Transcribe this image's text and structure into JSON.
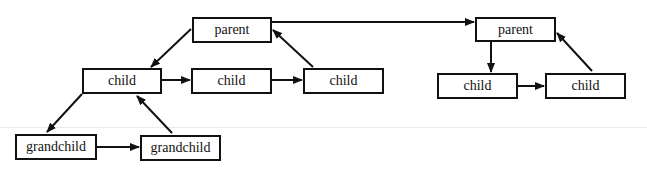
{
  "diagram": {
    "type": "tree-with-sibling-links",
    "colors": {
      "stroke": "#111111",
      "background": "#ffffff",
      "rule": "#ececec"
    },
    "nodes": [
      {
        "id": "p1",
        "label": "parent",
        "x": 192,
        "y": 17,
        "w": 80,
        "h": 26
      },
      {
        "id": "c1",
        "label": "child",
        "x": 82,
        "y": 68,
        "w": 80,
        "h": 26
      },
      {
        "id": "c2",
        "label": "child",
        "x": 191,
        "y": 68,
        "w": 81,
        "h": 26
      },
      {
        "id": "c3",
        "label": "child",
        "x": 303,
        "y": 68,
        "w": 81,
        "h": 26
      },
      {
        "id": "g1",
        "label": "grandchild",
        "x": 15,
        "y": 134,
        "w": 82,
        "h": 26
      },
      {
        "id": "g2",
        "label": "grandchild",
        "x": 140,
        "y": 135,
        "w": 81,
        "h": 26
      },
      {
        "id": "p2",
        "label": "parent",
        "x": 475,
        "y": 17,
        "w": 81,
        "h": 25
      },
      {
        "id": "c4",
        "label": "child",
        "x": 437,
        "y": 73,
        "w": 81,
        "h": 26
      },
      {
        "id": "c5",
        "label": "child",
        "x": 545,
        "y": 73,
        "w": 81,
        "h": 26
      }
    ],
    "edges": [
      {
        "from": "p1",
        "to": "c1",
        "x1": 191,
        "y1": 29,
        "x2": 151,
        "y2": 67
      },
      {
        "from": "c1",
        "to": "c2",
        "x1": 162,
        "y1": 80,
        "x2": 190,
        "y2": 80
      },
      {
        "from": "c2",
        "to": "c3",
        "x1": 272,
        "y1": 80,
        "x2": 302,
        "y2": 80
      },
      {
        "from": "c3",
        "to": "p1",
        "x1": 313,
        "y1": 67,
        "x2": 273,
        "y2": 30
      },
      {
        "from": "c1",
        "to": "g1",
        "x1": 82,
        "y1": 94,
        "x2": 47,
        "y2": 132
      },
      {
        "from": "g1",
        "to": "g2",
        "x1": 97,
        "y1": 147,
        "x2": 139,
        "y2": 147
      },
      {
        "from": "g2",
        "to": "c1",
        "x1": 172,
        "y1": 133,
        "x2": 137,
        "y2": 96
      },
      {
        "from": "p1",
        "to": "p2",
        "x1": 272,
        "y1": 22,
        "x2": 474,
        "y2": 22
      },
      {
        "from": "p2",
        "to": "c4",
        "x1": 491,
        "y1": 42,
        "x2": 491,
        "y2": 72
      },
      {
        "from": "c4",
        "to": "c5",
        "x1": 518,
        "y1": 86,
        "x2": 544,
        "y2": 86
      },
      {
        "from": "c5",
        "to": "p2",
        "x1": 592,
        "y1": 71,
        "x2": 557,
        "y2": 33
      }
    ]
  }
}
